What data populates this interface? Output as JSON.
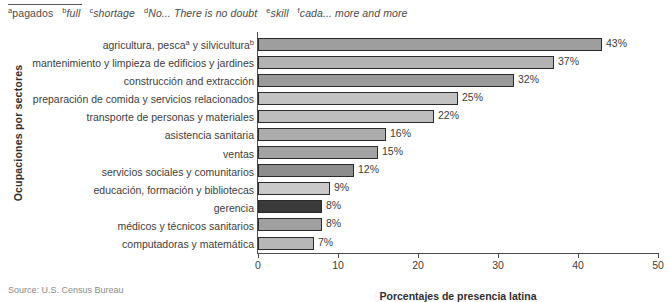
{
  "footnotes": [
    {
      "marker": "a",
      "text": "pagados",
      "italic": false
    },
    {
      "marker": "b",
      "text": "full",
      "italic": true
    },
    {
      "marker": "c",
      "text": "shortage",
      "italic": true
    },
    {
      "marker": "d",
      "text": "No... There is no doubt",
      "italic": true
    },
    {
      "marker": "e",
      "text": "skill",
      "italic": true
    },
    {
      "marker": "f",
      "text": "cada... more and more",
      "italic": true
    }
  ],
  "source": "Source: U.S. Census Bureau",
  "chart_data": {
    "type": "bar",
    "orientation": "horizontal",
    "title": "",
    "xlabel": "Porcentajes de presencia latina",
    "ylabel": "Ocupaciones por sectores",
    "xlim": [
      0,
      50
    ],
    "xticks": [
      0,
      10,
      20,
      30,
      40,
      50
    ],
    "grid": false,
    "legend": "none",
    "categories": [
      "agricultura, pescaᵃ y silviculturaᵇ",
      "mantenimiento y limpieza de edificios y jardines",
      "construcción and extracción",
      "preparación de comida y servicios relacionados",
      "transporte de personas y materiales",
      "asistencia sanitaria",
      "ventas",
      "servicios sociales y comunitarios",
      "educación, formación y bibliotecas",
      "gerencia",
      "médicos y técnicos sanitarios",
      "computadoras y matemática"
    ],
    "values": [
      43,
      37,
      32,
      25,
      22,
      16,
      15,
      12,
      9,
      8,
      8,
      7
    ],
    "value_labels": [
      "43%",
      "37%",
      "32%",
      "25%",
      "22%",
      "16%",
      "15%",
      "12%",
      "9%",
      "8%",
      "8%",
      "7%"
    ],
    "bar_colors": [
      "#9e9e9e",
      "#b3b3b3",
      "#9a9a9a",
      "#c2c2c2",
      "#bdbdbd",
      "#acacac",
      "#a3a3a3",
      "#8d8d8d",
      "#c9c9c9",
      "#3a3a3a",
      "#a0a0a0",
      "#b7b7b7"
    ],
    "bar_outline": "#2b2b2b"
  },
  "labels_html": [
    "agricultura, pesca<sup>a</sup> y silvicultura<sup>b</sup>",
    "mantenimiento y limpieza de edificios y jardines",
    "construcción and extracción",
    "preparación de comida y servicios relacionados",
    "transporte de personas y materiales",
    "asistencia sanitaria",
    "ventas",
    "servicios sociales y comunitarios",
    "educación, formación y bibliotecas",
    "gerencia",
    "médicos y técnicos sanitarios",
    "computadoras y matemática"
  ]
}
